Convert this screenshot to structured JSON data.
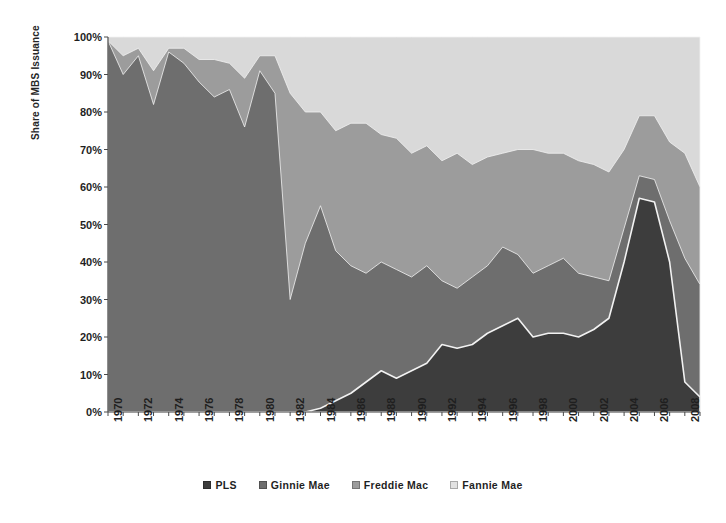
{
  "chart_data": {
    "type": "area",
    "stacked": true,
    "title": "",
    "xlabel": "",
    "ylabel": "Share of MBS Issuance",
    "ylim": [
      0,
      100
    ],
    "ytick_labels": [
      "0%",
      "10%",
      "20%",
      "30%",
      "40%",
      "50%",
      "60%",
      "70%",
      "80%",
      "90%",
      "100%"
    ],
    "ytick_values": [
      0,
      10,
      20,
      30,
      40,
      50,
      60,
      70,
      80,
      90,
      100
    ],
    "xlim": [
      1970,
      2009
    ],
    "xtick_labels": [
      "1970",
      "1972",
      "1974",
      "1976",
      "1978",
      "1980",
      "1982",
      "1984",
      "1986",
      "1988",
      "1990",
      "1992",
      "1994",
      "1996",
      "1998",
      "2000",
      "2002",
      "2004",
      "2006",
      "2008"
    ],
    "xtick_values": [
      1970,
      1972,
      1974,
      1976,
      1978,
      1980,
      1982,
      1984,
      1986,
      1988,
      1990,
      1992,
      1994,
      1996,
      1998,
      2000,
      2002,
      2004,
      2006,
      2008
    ],
    "grid": false,
    "legend_position": "bottom",
    "x": [
      1970,
      1971,
      1972,
      1973,
      1974,
      1975,
      1976,
      1977,
      1978,
      1979,
      1980,
      1981,
      1982,
      1983,
      1984,
      1985,
      1986,
      1987,
      1988,
      1989,
      1990,
      1991,
      1992,
      1993,
      1994,
      1995,
      1996,
      1997,
      1998,
      1999,
      2000,
      2001,
      2002,
      2003,
      2004,
      2005,
      2006,
      2007,
      2008,
      2009
    ],
    "series": [
      {
        "name": "PLS",
        "color": "#3d3d3d",
        "values": [
          0,
          0,
          0,
          0,
          0,
          0,
          0,
          0,
          0,
          0,
          0,
          0,
          0,
          0,
          1,
          3,
          5,
          8,
          11,
          9,
          11,
          13,
          18,
          17,
          18,
          21,
          23,
          25,
          20,
          21,
          21,
          20,
          22,
          25,
          40,
          57,
          56,
          40,
          8,
          4
        ]
      },
      {
        "name": "Ginnie Mae",
        "color": "#6e6e6e",
        "values": [
          99,
          90,
          95,
          82,
          96,
          93,
          88,
          84,
          86,
          76,
          91,
          85,
          30,
          45,
          54,
          40,
          34,
          29,
          29,
          29,
          25,
          26,
          17,
          16,
          18,
          18,
          21,
          17,
          17,
          18,
          20,
          17,
          14,
          10,
          9,
          6,
          6,
          11,
          33,
          30
        ]
      },
      {
        "name": "Freddie Mac",
        "color": "#9c9c9c",
        "values": [
          0,
          5,
          2,
          9,
          1,
          4,
          6,
          10,
          7,
          13,
          4,
          10,
          55,
          35,
          25,
          32,
          38,
          40,
          34,
          35,
          33,
          32,
          32,
          36,
          30,
          29,
          25,
          28,
          33,
          30,
          28,
          30,
          30,
          29,
          21,
          16,
          17,
          21,
          28,
          26
        ]
      },
      {
        "name": "Fannie Mae",
        "color": "#d9d9d9",
        "values": [
          1,
          5,
          3,
          9,
          3,
          3,
          6,
          6,
          7,
          11,
          5,
          5,
          15,
          20,
          20,
          25,
          23,
          23,
          26,
          27,
          31,
          29,
          33,
          31,
          34,
          32,
          31,
          30,
          30,
          31,
          31,
          33,
          34,
          36,
          30,
          21,
          21,
          28,
          31,
          40
        ]
      }
    ]
  },
  "legend": {
    "items": [
      {
        "label": "PLS",
        "color": "#3d3d3d"
      },
      {
        "label": "Ginnie Mae",
        "color": "#6e6e6e"
      },
      {
        "label": "Freddie Mac",
        "color": "#9c9c9c"
      },
      {
        "label": "Fannie Mae",
        "color": "#e2e2e2"
      }
    ]
  },
  "axes": {
    "y_title": "Share of MBS Issuance"
  },
  "style": {
    "axis_color": "#4a4a4a",
    "separator_color": "#f2f2f2",
    "background": "#ffffff"
  }
}
